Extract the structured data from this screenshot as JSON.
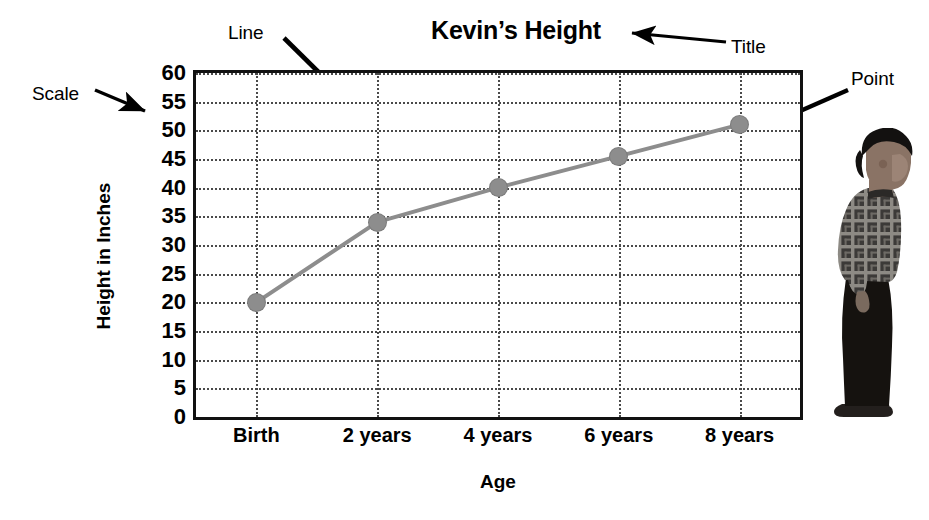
{
  "chart_data": {
    "type": "line",
    "title": "Kevin’s Height",
    "xlabel": "Age",
    "ylabel": "Height in Inches",
    "categories": [
      "Birth",
      "2 years",
      "4 years",
      "6 years",
      "8 years"
    ],
    "values": [
      20,
      34,
      40,
      45.5,
      51
    ],
    "ylim": [
      0,
      60
    ],
    "ytick_step": 5,
    "yticks": [
      0,
      5,
      10,
      15,
      20,
      25,
      30,
      35,
      40,
      45,
      50,
      55,
      60
    ],
    "ytick_labels": [
      "0",
      "5",
      "10",
      "15",
      "20",
      "25",
      "30",
      "35",
      "40",
      "45",
      "50",
      "55",
      "60"
    ],
    "grid": true,
    "grid_style": "dotted",
    "legend": false,
    "series": [
      {
        "name": "Kevin’s Height",
        "values": [
          20,
          34,
          40,
          45.5,
          51
        ],
        "color": "#8d8d8d",
        "marker": "circle"
      }
    ],
    "annotations": [
      {
        "label": "Scale",
        "target": "y-axis-tick-labels"
      },
      {
        "label": "Line",
        "target": "data-line"
      },
      {
        "label": "Title",
        "target": "chart-title"
      },
      {
        "label": "Point",
        "target": "data-point-8-years"
      }
    ]
  },
  "colors": {
    "line": "#8d8d8d",
    "marker": "#8d8d8d",
    "grid": "#4a4a4a",
    "frame": "#111111",
    "text": "#000000",
    "annotation_arrow": "#000000"
  },
  "photo": {
    "alt": "Photograph of a boy standing in profile wearing a plaid shirt and dark pants",
    "name": "boy-profile-photo"
  }
}
